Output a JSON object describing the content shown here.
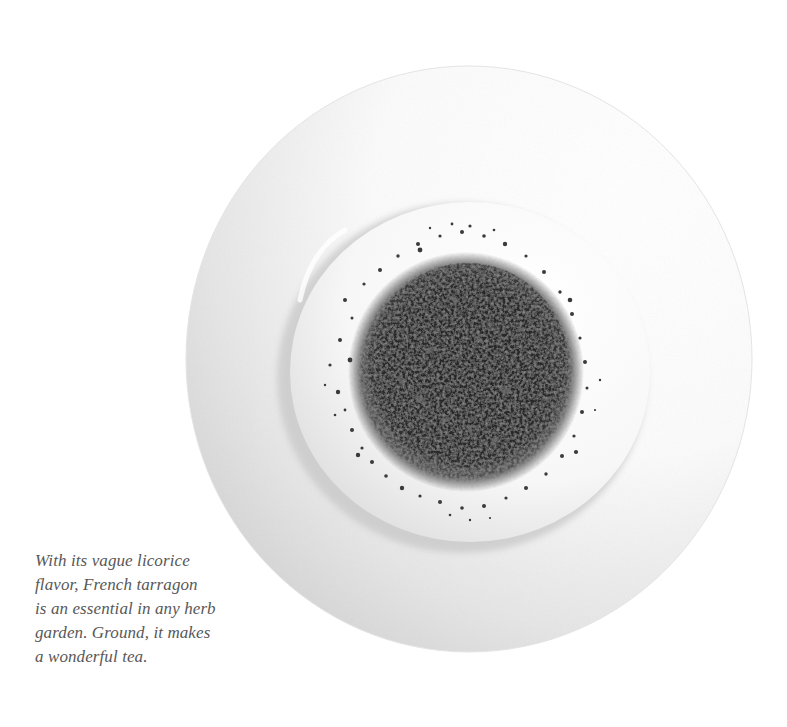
{
  "photo": {
    "subject": "Ground French tarragon on a white rimmed plate",
    "colors": {
      "background": "#ffffff",
      "plate_highlight": "#ffffff",
      "plate_shadow": "#cfcfcf",
      "well_shadow": "#c4c4c4",
      "herb_dark": "#1c1c1c",
      "herb_mid": "#4a4a4a",
      "herb_light": "#7a7a7a"
    }
  },
  "caption": {
    "lines": [
      "With its vague licorice",
      "flavor, French tarragon",
      "is an essential in any herb",
      "garden. Ground, it makes",
      "a wonderful tea."
    ]
  }
}
